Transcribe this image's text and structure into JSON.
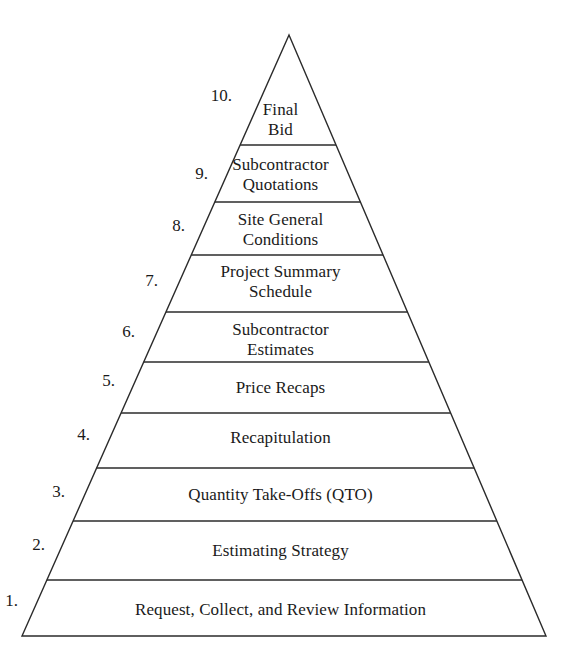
{
  "diagram": {
    "name": "estimating-process-pyramid",
    "type": "pyramid",
    "shape": {
      "apex_x": 289,
      "apex_y": 35,
      "base_left_x": 22,
      "base_right_x": 546,
      "base_y": 636,
      "stroke_color": "#2b2b2b",
      "fill_color": "#ffffff",
      "stroke_width": 1.4
    },
    "dividers_y": [
      145,
      202,
      255,
      312,
      362,
      413,
      468,
      521,
      580
    ],
    "levels": [
      {
        "number": "10.",
        "label": "Final\nBid",
        "label_x": 289,
        "label_y": 100,
        "num_x": 232,
        "num_y": 86
      },
      {
        "number": "9.",
        "label": "Subcontractor\nQuotations",
        "label_x": 289,
        "label_y": 155,
        "num_x": 208,
        "num_y": 164
      },
      {
        "number": "8.",
        "label": "Site General\nConditions",
        "label_x": 289,
        "label_y": 210,
        "num_x": 185,
        "num_y": 216
      },
      {
        "number": "7.",
        "label": "Project Summary\nSchedule",
        "label_x": 289,
        "label_y": 262,
        "num_x": 158,
        "num_y": 271
      },
      {
        "number": "6.",
        "label": "Subcontractor\nEstimates",
        "label_x": 289,
        "label_y": 320,
        "num_x": 135,
        "num_y": 322
      },
      {
        "number": "5.",
        "label": "Price Recaps",
        "label_x": 289,
        "label_y": 378,
        "num_x": 115,
        "num_y": 371
      },
      {
        "number": "4.",
        "label": "Recapitulation",
        "label_x": 289,
        "label_y": 428,
        "num_x": 90,
        "num_y": 425
      },
      {
        "number": "3.",
        "label": "Quantity Take-Offs (QTO)",
        "label_x": 289,
        "label_y": 485,
        "num_x": 65,
        "num_y": 482
      },
      {
        "number": "2.",
        "label": "Estimating Strategy",
        "label_x": 289,
        "label_y": 541,
        "num_x": 45,
        "num_y": 535
      },
      {
        "number": "1.",
        "label": "Request, Collect, and Review Information",
        "label_x": 289,
        "label_y": 600,
        "num_x": 18,
        "num_y": 591
      }
    ]
  }
}
